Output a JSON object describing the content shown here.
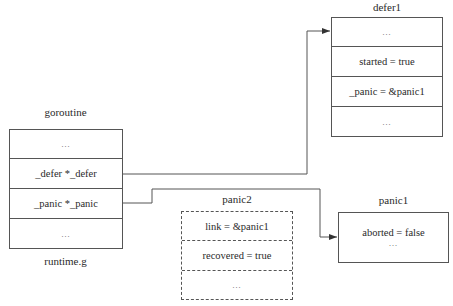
{
  "goroutine": {
    "title": "goroutine",
    "caption": "runtime.g",
    "rows": [
      "…",
      "_defer *_defer",
      "_panic *_panic",
      "…"
    ]
  },
  "defer1": {
    "title": "defer1",
    "rows": [
      "…",
      "started = true",
      "_panic = &panic1",
      "…"
    ]
  },
  "panic2": {
    "title": "panic2",
    "style": "dashed",
    "rows": [
      "link = &panic1",
      "recovered = true",
      "…"
    ]
  },
  "panic1": {
    "title": "panic1",
    "lines": [
      "aborted = false",
      "…"
    ]
  },
  "edges": [
    {
      "from": "goroutine._defer",
      "to": "defer1"
    },
    {
      "from": "goroutine._panic",
      "to": "panic1"
    }
  ],
  "colors": {
    "line": "#555555",
    "text": "#2a2a2a"
  }
}
